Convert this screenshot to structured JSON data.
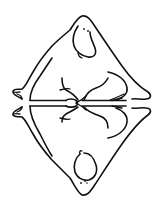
{
  "image": {
    "description": "Line drawing of a seated blob-like figure and its mirror reflection across a horizontal line",
    "alt": "Seated figure with reflection",
    "colors": {
      "background": "#ffffff",
      "ink": "#111111"
    },
    "elements": [
      {
        "name": "upper-figure",
        "icon": "seated-figure"
      },
      {
        "name": "mirror-line",
        "icon": "double-horizontal-line"
      },
      {
        "name": "lower-figure-reflection",
        "icon": "seated-figure-inverted"
      }
    ]
  }
}
